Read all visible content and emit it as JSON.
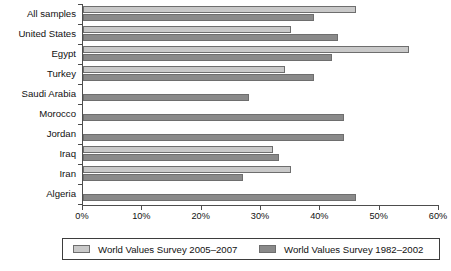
{
  "chart_data": {
    "type": "bar",
    "orientation": "horizontal",
    "title": "",
    "subtitle": "",
    "xlabel": "",
    "ylabel": "",
    "xlim": [
      0,
      60
    ],
    "xunit": "%",
    "grid": false,
    "legend_position": "bottom",
    "categories": [
      "All samples",
      "United States",
      "Egypt",
      "Turkey",
      "Saudi Arabia",
      "Morocco",
      "Jordan",
      "Iraq",
      "Iran",
      "Algeria"
    ],
    "xticks": [
      "0%",
      "10%",
      "20%",
      "30%",
      "40%",
      "50%",
      "60%"
    ],
    "xtick_values": [
      0,
      10,
      20,
      30,
      40,
      50,
      60
    ],
    "series": [
      {
        "name": "World Values Survey 2005–2007",
        "color": "#c9c9c9",
        "values": [
          46,
          35,
          55,
          34,
          null,
          null,
          null,
          32,
          35,
          null
        ]
      },
      {
        "name": "World Values Survey 1982–2002",
        "color": "#8a8a8a",
        "values": [
          39,
          43,
          42,
          39,
          28,
          44,
          44,
          33,
          27,
          46
        ]
      }
    ]
  },
  "legend": {
    "items": [
      {
        "label": "World Values Survey 2005–2007",
        "swatch": "#c9c9c9"
      },
      {
        "label": "World Values Survey 1982–2002",
        "swatch": "#8a8a8a"
      }
    ]
  }
}
